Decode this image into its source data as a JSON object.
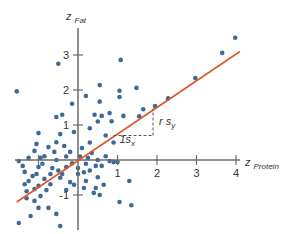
{
  "chart_data": {
    "type": "scatter",
    "title": "",
    "xlabel": "z",
    "xlabel_sub": "Protein",
    "ylabel": "z",
    "ylabel_sub": "Fat",
    "xlim": [
      -1.6,
      4.2
    ],
    "ylim": [
      -2.0,
      3.8
    ],
    "x_ticks": [
      -1,
      1,
      2,
      3,
      4
    ],
    "x_tick_labels": [
      "",
      "1",
      "2",
      "3",
      "4"
    ],
    "y_ticks": [
      -1,
      1,
      2,
      3
    ],
    "y_tick_labels": [
      "-1",
      "1",
      "2",
      "3"
    ],
    "grid": false,
    "legend": null,
    "colors": {
      "points": "#3d6a96",
      "line": "#e0572a",
      "axis": "#6b6b6b",
      "dash": "#555555"
    },
    "regression_line": {
      "x": [
        -1.55,
        4.1
      ],
      "y": [
        -1.2,
        3.1
      ],
      "slope": 0.76
    },
    "annotations": [
      {
        "text": "1s",
        "sub": "x",
        "x": 1.05,
        "y": 0.55
      },
      {
        "text": "r s",
        "sub": "y",
        "x": 2.0,
        "y": 1.05
      }
    ],
    "slope_triangle": {
      "x0": 0.9,
      "y0": 0.7,
      "x1": 1.9,
      "y1": 1.47
    },
    "series": [
      {
        "name": "observations",
        "points": [
          [
            3.98,
            3.49
          ],
          [
            3.65,
            3.06
          ],
          [
            2.97,
            2.34
          ],
          [
            1.95,
            1.54
          ],
          [
            2.28,
            1.76
          ],
          [
            1.65,
            1.45
          ],
          [
            1.08,
            2.86
          ],
          [
            1.48,
            2.06
          ],
          [
            0.55,
            2.14
          ],
          [
            0.42,
            1.29
          ],
          [
            -0.15,
            1.61
          ],
          [
            0.2,
            1.83
          ],
          [
            1.05,
            1.98
          ],
          [
            1.05,
            1.8
          ],
          [
            0.55,
            1.67
          ],
          [
            0.85,
            1.11
          ],
          [
            0.5,
            1.1
          ],
          [
            0.6,
            1.26
          ],
          [
            0.8,
            1.34
          ],
          [
            1.15,
            1.26
          ],
          [
            0.3,
            0.91
          ],
          [
            0.7,
            0.7
          ],
          [
            0.9,
            0.5
          ],
          [
            1.55,
            1.25
          ],
          [
            -0.5,
            2.75
          ],
          [
            -0.4,
            1.29
          ],
          [
            -0.55,
            1.23
          ],
          [
            -1.55,
            1.96
          ],
          [
            -1.0,
            0.77
          ],
          [
            -0.45,
            0.74
          ],
          [
            -0.35,
            0.4
          ],
          [
            -0.1,
            0.8
          ],
          [
            0.3,
            0.5
          ],
          [
            0.1,
            0.34
          ],
          [
            0.35,
            0.2
          ],
          [
            0.25,
            0.06
          ],
          [
            0.05,
            0.1
          ],
          [
            -0.3,
            0.1
          ],
          [
            -0.55,
            0.0
          ],
          [
            -0.75,
            0.37
          ],
          [
            -0.85,
            0.11
          ],
          [
            -1.05,
            0.46
          ],
          [
            -1.1,
            0.26
          ],
          [
            -1.25,
            0.06
          ],
          [
            -1.0,
            -0.2
          ],
          [
            -1.05,
            -0.4
          ],
          [
            -1.15,
            -0.46
          ],
          [
            -1.25,
            -0.6
          ],
          [
            -1.35,
            -0.69
          ],
          [
            -1.3,
            -0.89
          ],
          [
            -1.1,
            -0.83
          ],
          [
            -1.0,
            -0.74
          ],
          [
            -0.85,
            -0.54
          ],
          [
            -0.7,
            -0.4
          ],
          [
            -0.5,
            -0.3
          ],
          [
            -0.3,
            -0.2
          ],
          [
            -0.15,
            -0.09
          ],
          [
            0.0,
            -0.23
          ],
          [
            0.2,
            -0.11
          ],
          [
            0.45,
            -0.17
          ],
          [
            0.6,
            -0.17
          ],
          [
            0.8,
            -0.03
          ],
          [
            0.5,
            -0.49
          ],
          [
            0.2,
            -0.6
          ],
          [
            -0.2,
            -0.63
          ],
          [
            -0.45,
            -0.51
          ],
          [
            -0.7,
            -0.69
          ],
          [
            -0.95,
            -1.03
          ],
          [
            -1.1,
            -1.17
          ],
          [
            -1.3,
            -1.09
          ],
          [
            -1.0,
            -1.37
          ],
          [
            -0.75,
            -1.37
          ],
          [
            -0.55,
            -1.54
          ],
          [
            -1.2,
            -1.6
          ],
          [
            -1.5,
            -1.8
          ],
          [
            -0.45,
            -1.89
          ],
          [
            -0.3,
            -0.86
          ],
          [
            -0.1,
            -0.71
          ],
          [
            0.15,
            -0.8
          ],
          [
            0.4,
            -0.94
          ],
          [
            0.45,
            -0.8
          ],
          [
            0.65,
            -0.71
          ],
          [
            0.9,
            -0.06
          ],
          [
            1.0,
            -0.06
          ],
          [
            1.3,
            -0.6
          ],
          [
            1.35,
            -1.29
          ],
          [
            1.05,
            -1.2
          ],
          [
            0.0,
            -0.4
          ],
          [
            -0.2,
            0.23
          ],
          [
            -0.6,
            0.23
          ],
          [
            -0.95,
            0.06
          ],
          [
            -0.9,
            -0.11
          ],
          [
            -0.65,
            -0.23
          ],
          [
            -0.4,
            -0.4
          ],
          [
            -1.35,
            -0.34
          ],
          [
            -1.4,
            -0.17
          ],
          [
            -1.5,
            -0.03
          ],
          [
            -0.8,
            -0.86
          ],
          [
            0.15,
            -0.35
          ],
          [
            0.5,
            0.0
          ],
          [
            0.7,
            0.11
          ],
          [
            0.3,
            -0.3
          ],
          [
            -0.55,
            0.51
          ],
          [
            0.55,
            -1.0
          ]
        ]
      }
    ]
  }
}
